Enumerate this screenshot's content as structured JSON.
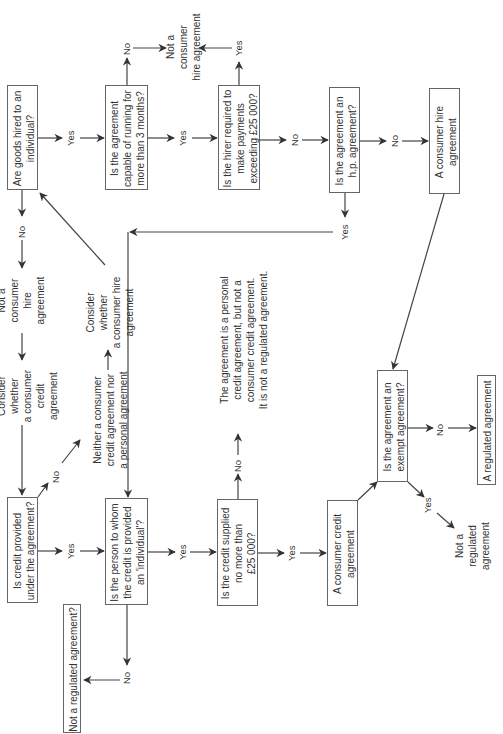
{
  "diagram": {
    "orientation": "rotated 90 degrees counter-clockwise",
    "hire_branch": {
      "q_goods_hired": "Are goods hired to an\nindividual?",
      "q_capable_running": "Is the agreement\ncapable of running for\nmore than 3 months?",
      "q_hirer_required": "Is the hirer required to\nmake payments\nexceeding £25 000?",
      "q_hp_agreement": "Is the agreement an\nh.p. agreement?",
      "r_consumer_hire": "A consumer hire\nagreement",
      "r_not_consumer_hire_top": "Not a consumer\nhire agreement"
    },
    "credit_branch": {
      "q_credit_provided": "Is credit provided\nunder the agreement?",
      "q_person_individual": "Is the person to whom\nthe credit is provided\nan 'individual'?",
      "q_credit_supplied": "Is the credit supplied\nno more than\n£25 000?",
      "r_consumer_credit": "A consumer credit\nagreement",
      "q_exempt": "Is the agreement an\nexempt agreement?",
      "r_regulated": "A regulated agreement",
      "r_not_regulated_exempt": "Not a regulated\nagreement",
      "r_not_regulated_q": "Not a regulated agreement?",
      "r_personal_credit": "The agreement is a personal\ncredit agreement, but not a\nconsumer credit agreement.\nIt is not a regulated agreement."
    },
    "middle": {
      "not_consumer_hire_mid": "Not a consumer\nhire agreement",
      "consider_consumer_credit": "Consider whether\na consumer\ncredit agreement",
      "consider_consumer_hire": "Consider whether\na consumer hire\nagreement",
      "neither": "Neither a consumer\ncredit agreement nor\na personal agreement"
    },
    "edge_labels": {
      "yes": "Yes",
      "no": "No"
    }
  }
}
